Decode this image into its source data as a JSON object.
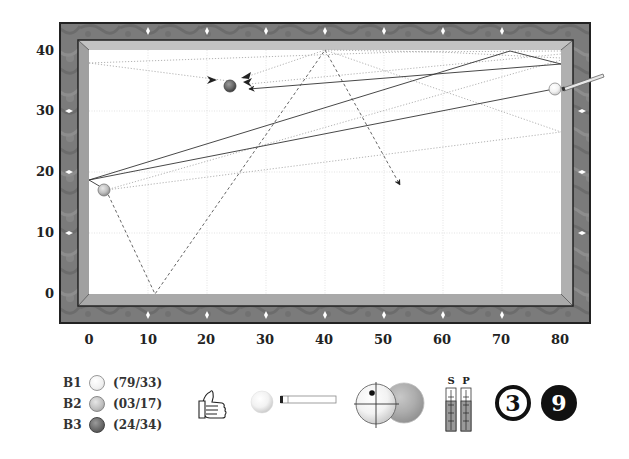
{
  "table": {
    "x_ticks": [
      "0",
      "10",
      "20",
      "30",
      "40",
      "50",
      "60",
      "70",
      "80"
    ],
    "y_ticks": [
      "40",
      "30",
      "20",
      "10",
      "0"
    ],
    "colors": {
      "frame": "#7a7a7a",
      "frame_border": "#222222",
      "cushion": "#b5b5b5",
      "cloth": "#ffffff",
      "grid": "#d9d9d9",
      "diamond": "#ffffff"
    }
  },
  "balls": [
    {
      "key": "B1",
      "coords": "(79/33)",
      "x": 79,
      "y": 33,
      "shade": "white"
    },
    {
      "key": "B2",
      "coords": "(03/17)",
      "x": 3,
      "y": 17,
      "shade": "light-grey"
    },
    {
      "key": "B3",
      "coords": "(24/34)",
      "x": 24,
      "y": 34,
      "shade": "dark-grey"
    }
  ],
  "legend": {
    "rows": [
      {
        "label": "B1",
        "value": "(79/33)"
      },
      {
        "label": "B2",
        "value": "(03/17)"
      },
      {
        "label": "B3",
        "value": "(24/34)"
      }
    ]
  },
  "controls": {
    "rating_icon": "thumbs-up-icon",
    "cue_icon": "cue-ball-and-stick-icon",
    "hit_point_icon": "ball-contact-icon",
    "gauges": {
      "speed_label": "S",
      "power_label": "P"
    },
    "numbered_balls": [
      "3",
      "9"
    ]
  }
}
